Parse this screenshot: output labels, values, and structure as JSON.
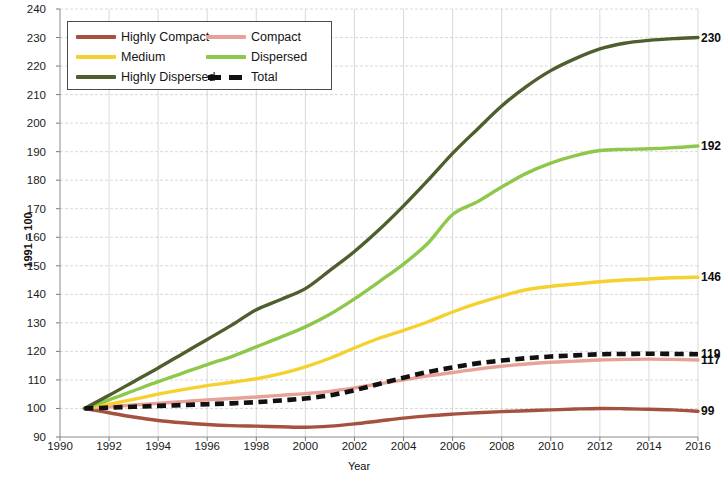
{
  "chart_data": {
    "type": "line",
    "title": "",
    "xlabel": "Year",
    "ylabel": "1991 = 100",
    "xlim": [
      1990,
      2016
    ],
    "ylim": [
      90,
      240
    ],
    "xticks": [
      1990,
      1992,
      1994,
      1996,
      1998,
      2000,
      2002,
      2004,
      2006,
      2008,
      2010,
      2012,
      2014,
      2016
    ],
    "yticks": [
      90,
      100,
      110,
      120,
      130,
      140,
      150,
      160,
      170,
      180,
      190,
      200,
      210,
      220,
      230,
      240
    ],
    "grid": true,
    "legend_position": "top-left",
    "x": [
      1991,
      1992,
      1993,
      1994,
      1995,
      1996,
      1997,
      1998,
      1999,
      2000,
      2001,
      2002,
      2003,
      2004,
      2005,
      2006,
      2007,
      2008,
      2009,
      2010,
      2011,
      2012,
      2013,
      2014,
      2015,
      2016
    ],
    "series": [
      {
        "name": "Highly Compact",
        "color": "#a4523f",
        "style": "solid",
        "end_label": "99",
        "values": [
          100,
          98.5,
          97.0,
          95.8,
          95.0,
          94.4,
          94.0,
          93.8,
          93.6,
          93.4,
          93.8,
          94.6,
          95.6,
          96.6,
          97.4,
          98.0,
          98.5,
          98.9,
          99.2,
          99.5,
          99.8,
          100.0,
          99.9,
          99.7,
          99.5,
          99.0
        ]
      },
      {
        "name": "Compact",
        "color": "#e8a196",
        "style": "solid",
        "end_label": "117",
        "values": [
          100,
          100.6,
          101.2,
          101.8,
          102.4,
          103.0,
          103.5,
          104.0,
          104.6,
          105.2,
          106.0,
          107.2,
          108.6,
          110.0,
          111.4,
          112.6,
          113.8,
          114.8,
          115.6,
          116.2,
          116.6,
          117.0,
          117.2,
          117.3,
          117.2,
          117.0
        ]
      },
      {
        "name": "Medium",
        "color": "#f5d12f",
        "style": "solid",
        "end_label": "146",
        "values": [
          100,
          101.5,
          103.2,
          105.0,
          106.6,
          108.0,
          109.2,
          110.4,
          112.2,
          114.6,
          117.6,
          121.2,
          124.6,
          127.4,
          130.4,
          133.8,
          136.8,
          139.4,
          141.6,
          142.8,
          143.6,
          144.4,
          145.0,
          145.4,
          145.8,
          146.0
        ]
      },
      {
        "name": "Dispersed",
        "color": "#8ec84b",
        "style": "solid",
        "end_label": "192",
        "values": [
          100,
          103.0,
          106.2,
          109.4,
          112.4,
          115.4,
          118.2,
          121.6,
          125.0,
          128.6,
          133.0,
          138.4,
          144.4,
          150.6,
          158.0,
          168.0,
          172.4,
          177.6,
          182.4,
          186.0,
          188.6,
          190.4,
          190.8,
          191.0,
          191.4,
          192.0
        ]
      },
      {
        "name": "Highly Dispersed",
        "color": "#4e5e2d",
        "style": "solid",
        "end_label": "230",
        "values": [
          100,
          104.6,
          109.4,
          114.2,
          119.2,
          124.2,
          129.2,
          134.6,
          138.2,
          142.0,
          148.4,
          155.0,
          162.6,
          171.0,
          180.0,
          189.4,
          197.8,
          206.0,
          212.8,
          218.4,
          222.6,
          226.0,
          228.0,
          229.0,
          229.6,
          230.0
        ]
      },
      {
        "name": "Total",
        "color": "#111111",
        "style": "dashed",
        "end_label": "119",
        "values": [
          100,
          100.3,
          100.6,
          100.9,
          101.2,
          101.5,
          101.8,
          102.2,
          102.8,
          103.5,
          104.6,
          106.4,
          108.6,
          110.8,
          112.8,
          114.4,
          115.8,
          116.8,
          117.6,
          118.2,
          118.6,
          119.0,
          119.1,
          119.2,
          119.1,
          119.0
        ]
      }
    ]
  },
  "legend": {
    "entries": [
      {
        "label": "Highly Compact"
      },
      {
        "label": "Compact"
      },
      {
        "label": "Medium"
      },
      {
        "label": "Dispersed"
      },
      {
        "label": "Highly Dispersed"
      },
      {
        "label": "Total"
      }
    ]
  },
  "axes": {
    "y_title": "1991 = 100",
    "x_title": "Year"
  }
}
